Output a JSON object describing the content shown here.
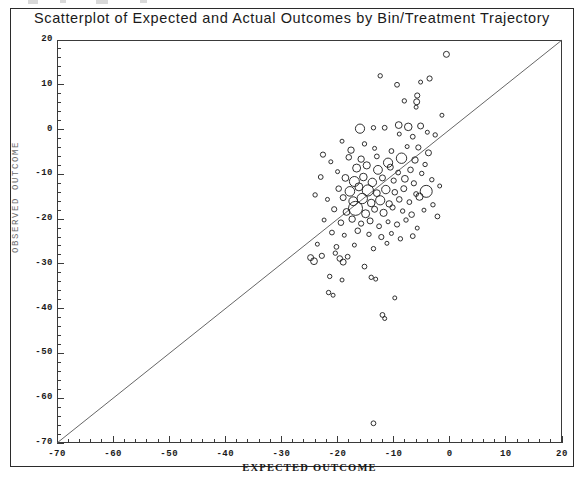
{
  "figure": {
    "title": "Scatterplot of Expected and Actual Outcomes by Bin/Treatment Trajectory"
  },
  "chart_data": {
    "type": "scatter",
    "title": "Scatterplot of Expected and Actual Outcomes by Bin/Treatment Trajectory",
    "xlabel": "EXPECTED OUTCOME",
    "ylabel": "OBSERVED OUTCOME",
    "xlim": [
      -70,
      20
    ],
    "ylim": [
      -70,
      20
    ],
    "xticks": [
      -70,
      -60,
      -50,
      -40,
      -30,
      -20,
      -10,
      0,
      10,
      20
    ],
    "yticks": [
      20,
      10,
      0,
      -10,
      -20,
      -30,
      -40,
      -50,
      -60,
      -70
    ],
    "xtick_labels": [
      "-70",
      "-60",
      "-50",
      "-40",
      "-30",
      "-20",
      "-10",
      "0",
      "10",
      "20"
    ],
    "ytick_labels": [
      "20",
      "10",
      "0",
      "-10",
      "-20",
      "-30",
      "-40",
      "-50",
      "-60",
      "-70"
    ],
    "minor_ticks_per_major": 5,
    "grid": false,
    "legend": false,
    "marker": "open-circle",
    "marker_size_encodes": "bubble weight",
    "reference_line": {
      "type": "identity",
      "label": "y = x",
      "from": [
        -70,
        -70
      ],
      "to": [
        20,
        20
      ]
    },
    "points": [
      {
        "x": -0.6,
        "y": 16.8,
        "r": 3.0
      },
      {
        "x": -3.6,
        "y": 11.4,
        "r": 2.6
      },
      {
        "x": -5.2,
        "y": 10.6,
        "r": 2.0
      },
      {
        "x": -9.4,
        "y": 10.0,
        "r": 2.4
      },
      {
        "x": -12.4,
        "y": 12.0,
        "r": 2.2
      },
      {
        "x": -5.8,
        "y": 7.6,
        "r": 2.6
      },
      {
        "x": -5.9,
        "y": 6.2,
        "r": 3.0
      },
      {
        "x": -6.0,
        "y": 5.0,
        "r": 2.0
      },
      {
        "x": -8.1,
        "y": 6.4,
        "r": 2.2
      },
      {
        "x": -1.4,
        "y": 3.2,
        "r": 2.0
      },
      {
        "x": -9.1,
        "y": 1.0,
        "r": 3.4
      },
      {
        "x": -7.4,
        "y": 0.6,
        "r": 3.8
      },
      {
        "x": -5.2,
        "y": 0.8,
        "r": 3.0
      },
      {
        "x": -11.6,
        "y": 0.4,
        "r": 2.4
      },
      {
        "x": -13.6,
        "y": 0.4,
        "r": 2.2
      },
      {
        "x": -16.0,
        "y": 0.2,
        "r": 4.6
      },
      {
        "x": -4.0,
        "y": -0.6,
        "r": 2.0
      },
      {
        "x": -6.6,
        "y": -1.6,
        "r": 2.4
      },
      {
        "x": -9.0,
        "y": -1.0,
        "r": 2.0
      },
      {
        "x": -2.6,
        "y": -1.2,
        "r": 2.2
      },
      {
        "x": -19.2,
        "y": -2.6,
        "r": 2.0
      },
      {
        "x": -15.2,
        "y": -3.2,
        "r": 2.2
      },
      {
        "x": -17.6,
        "y": -4.6,
        "r": 3.2
      },
      {
        "x": -13.4,
        "y": -4.2,
        "r": 2.0
      },
      {
        "x": -10.4,
        "y": -4.8,
        "r": 2.4
      },
      {
        "x": -7.6,
        "y": -3.8,
        "r": 2.0
      },
      {
        "x": -5.6,
        "y": -4.0,
        "r": 2.6
      },
      {
        "x": -3.8,
        "y": -5.2,
        "r": 3.0
      },
      {
        "x": -22.6,
        "y": -5.6,
        "r": 2.6
      },
      {
        "x": -21.2,
        "y": -7.2,
        "r": 2.0
      },
      {
        "x": -18.0,
        "y": -6.2,
        "r": 2.8
      },
      {
        "x": -15.8,
        "y": -6.6,
        "r": 3.2
      },
      {
        "x": -13.0,
        "y": -6.0,
        "r": 2.4
      },
      {
        "x": -11.0,
        "y": -7.4,
        "r": 4.6
      },
      {
        "x": -8.6,
        "y": -6.4,
        "r": 5.2
      },
      {
        "x": -6.2,
        "y": -6.8,
        "r": 3.2
      },
      {
        "x": -4.4,
        "y": -7.8,
        "r": 2.2
      },
      {
        "x": -16.6,
        "y": -8.6,
        "r": 4.0
      },
      {
        "x": -14.8,
        "y": -8.0,
        "r": 3.6
      },
      {
        "x": -12.8,
        "y": -9.0,
        "r": 4.4
      },
      {
        "x": -10.6,
        "y": -8.4,
        "r": 3.0
      },
      {
        "x": -9.2,
        "y": -9.6,
        "r": 2.4
      },
      {
        "x": -7.0,
        "y": -9.0,
        "r": 2.8
      },
      {
        "x": -5.0,
        "y": -9.8,
        "r": 2.2
      },
      {
        "x": -20.0,
        "y": -9.4,
        "r": 2.0
      },
      {
        "x": -23.0,
        "y": -10.6,
        "r": 2.4
      },
      {
        "x": -18.6,
        "y": -10.8,
        "r": 3.4
      },
      {
        "x": -17.0,
        "y": -11.6,
        "r": 5.0
      },
      {
        "x": -15.4,
        "y": -10.6,
        "r": 3.8
      },
      {
        "x": -13.8,
        "y": -11.8,
        "r": 4.2
      },
      {
        "x": -12.0,
        "y": -10.8,
        "r": 3.0
      },
      {
        "x": -10.0,
        "y": -11.4,
        "r": 2.6
      },
      {
        "x": -8.0,
        "y": -11.0,
        "r": 3.4
      },
      {
        "x": -6.4,
        "y": -12.0,
        "r": 2.6
      },
      {
        "x": -3.2,
        "y": -11.2,
        "r": 2.2
      },
      {
        "x": -1.8,
        "y": -12.6,
        "r": 2.0
      },
      {
        "x": -19.8,
        "y": -13.2,
        "r": 2.8
      },
      {
        "x": -17.8,
        "y": -13.8,
        "r": 4.8
      },
      {
        "x": -16.2,
        "y": -12.8,
        "r": 4.0
      },
      {
        "x": -14.6,
        "y": -13.6,
        "r": 5.6
      },
      {
        "x": -13.0,
        "y": -14.2,
        "r": 3.4
      },
      {
        "x": -11.4,
        "y": -13.4,
        "r": 4.2
      },
      {
        "x": -9.8,
        "y": -14.0,
        "r": 2.8
      },
      {
        "x": -8.2,
        "y": -13.2,
        "r": 3.0
      },
      {
        "x": -6.0,
        "y": -14.4,
        "r": 2.4
      },
      {
        "x": -4.2,
        "y": -13.8,
        "r": 6.0
      },
      {
        "x": -24.0,
        "y": -14.6,
        "r": 2.2
      },
      {
        "x": -21.8,
        "y": -15.6,
        "r": 2.0
      },
      {
        "x": -19.0,
        "y": -15.2,
        "r": 3.0
      },
      {
        "x": -17.2,
        "y": -16.0,
        "r": 4.4
      },
      {
        "x": -15.6,
        "y": -15.4,
        "r": 5.2
      },
      {
        "x": -14.0,
        "y": -16.4,
        "r": 3.8
      },
      {
        "x": -12.4,
        "y": -15.8,
        "r": 4.6
      },
      {
        "x": -10.8,
        "y": -16.6,
        "r": 3.2
      },
      {
        "x": -9.0,
        "y": -15.6,
        "r": 2.8
      },
      {
        "x": -7.2,
        "y": -16.2,
        "r": 2.4
      },
      {
        "x": -5.4,
        "y": -15.0,
        "r": 3.6
      },
      {
        "x": -3.0,
        "y": -16.8,
        "r": 2.2
      },
      {
        "x": -20.6,
        "y": -17.8,
        "r": 2.6
      },
      {
        "x": -18.4,
        "y": -18.4,
        "r": 3.4
      },
      {
        "x": -16.8,
        "y": -17.6,
        "r": 7.0
      },
      {
        "x": -15.0,
        "y": -18.8,
        "r": 4.0
      },
      {
        "x": -13.4,
        "y": -17.8,
        "r": 3.0
      },
      {
        "x": -11.8,
        "y": -18.6,
        "r": 3.6
      },
      {
        "x": -10.2,
        "y": -17.4,
        "r": 2.6
      },
      {
        "x": -8.4,
        "y": -18.2,
        "r": 2.2
      },
      {
        "x": -6.8,
        "y": -19.0,
        "r": 2.8
      },
      {
        "x": -4.6,
        "y": -18.0,
        "r": 2.0
      },
      {
        "x": -2.2,
        "y": -19.4,
        "r": 2.4
      },
      {
        "x": -22.4,
        "y": -20.2,
        "r": 2.0
      },
      {
        "x": -19.4,
        "y": -20.8,
        "r": 2.8
      },
      {
        "x": -17.4,
        "y": -20.0,
        "r": 3.2
      },
      {
        "x": -15.8,
        "y": -21.0,
        "r": 2.6
      },
      {
        "x": -14.2,
        "y": -20.4,
        "r": 3.0
      },
      {
        "x": -12.6,
        "y": -21.6,
        "r": 2.4
      },
      {
        "x": -11.0,
        "y": -20.6,
        "r": 2.0
      },
      {
        "x": -9.4,
        "y": -21.2,
        "r": 2.6
      },
      {
        "x": -7.8,
        "y": -20.2,
        "r": 2.2
      },
      {
        "x": -5.8,
        "y": -22.0,
        "r": 2.0
      },
      {
        "x": -21.0,
        "y": -23.0,
        "r": 2.4
      },
      {
        "x": -18.8,
        "y": -23.6,
        "r": 2.0
      },
      {
        "x": -16.4,
        "y": -22.6,
        "r": 2.8
      },
      {
        "x": -14.4,
        "y": -23.4,
        "r": 2.2
      },
      {
        "x": -12.2,
        "y": -24.0,
        "r": 2.6
      },
      {
        "x": -10.4,
        "y": -23.2,
        "r": 2.0
      },
      {
        "x": -8.8,
        "y": -24.4,
        "r": 2.2
      },
      {
        "x": -6.6,
        "y": -23.8,
        "r": 2.4
      },
      {
        "x": -23.6,
        "y": -25.6,
        "r": 2.0
      },
      {
        "x": -20.2,
        "y": -26.2,
        "r": 2.4
      },
      {
        "x": -17.0,
        "y": -25.8,
        "r": 2.0
      },
      {
        "x": -13.6,
        "y": -26.6,
        "r": 2.2
      },
      {
        "x": -11.2,
        "y": -25.4,
        "r": 2.0
      },
      {
        "x": -24.8,
        "y": -28.6,
        "r": 3.0
      },
      {
        "x": -24.2,
        "y": -29.4,
        "r": 3.4
      },
      {
        "x": -22.8,
        "y": -28.2,
        "r": 2.6
      },
      {
        "x": -19.6,
        "y": -28.8,
        "r": 2.8
      },
      {
        "x": -19.0,
        "y": -29.6,
        "r": 3.0
      },
      {
        "x": -18.2,
        "y": -28.4,
        "r": 2.4
      },
      {
        "x": -20.4,
        "y": -27.6,
        "r": 2.2
      },
      {
        "x": -15.2,
        "y": -30.6,
        "r": 2.4
      },
      {
        "x": -21.4,
        "y": -32.8,
        "r": 2.2
      },
      {
        "x": -19.2,
        "y": -33.6,
        "r": 2.0
      },
      {
        "x": -14.0,
        "y": -33.0,
        "r": 2.2
      },
      {
        "x": -13.2,
        "y": -33.4,
        "r": 2.0
      },
      {
        "x": -21.6,
        "y": -36.4,
        "r": 2.2
      },
      {
        "x": -20.8,
        "y": -37.0,
        "r": 2.0
      },
      {
        "x": -9.8,
        "y": -37.6,
        "r": 2.0
      },
      {
        "x": -12.0,
        "y": -41.4,
        "r": 2.4
      },
      {
        "x": -11.6,
        "y": -42.2,
        "r": 2.0
      },
      {
        "x": -13.6,
        "y": -65.6,
        "r": 2.4
      }
    ]
  },
  "axes": {
    "xlabel": "EXPECTED OUTCOME",
    "ylabel": "OBSERVED OUTCOME"
  }
}
